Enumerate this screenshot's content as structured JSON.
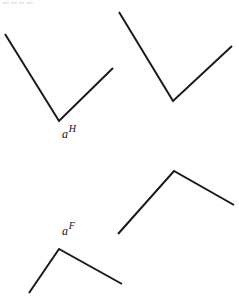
{
  "figure": {
    "background_color": "#ffffff",
    "stroke_color": "#1a1a1a",
    "stroke_width": 2,
    "width": 239,
    "height": 299
  },
  "labels": {
    "angle_h": {
      "base": "a",
      "superscript": "H",
      "full": "aH"
    },
    "angle_f": {
      "base": "a",
      "superscript": "F",
      "full": "aF"
    }
  },
  "shapes": {
    "top_left_v": {
      "name": "top-left-v-angle",
      "orientation": "V",
      "points": "5,34 59,121 113,68",
      "label": "aH"
    },
    "top_right_v": {
      "name": "top-right-v-angle",
      "orientation": "V",
      "points": "119,12 173,101 232,46",
      "label": ""
    },
    "bottom_left_caret": {
      "name": "bottom-left-caret-angle",
      "orientation": "Lambda",
      "points": "29,293 59,249 122,284",
      "label": "aF"
    },
    "bottom_right_caret": {
      "name": "bottom-right-caret-angle",
      "orientation": "Lambda",
      "points": "118,234 174,171 234,205",
      "label": ""
    }
  },
  "artifacts": {
    "corner_smudge": {
      "name": "scan-artifact",
      "description": "faint light-gray marks at top-left corner"
    }
  }
}
